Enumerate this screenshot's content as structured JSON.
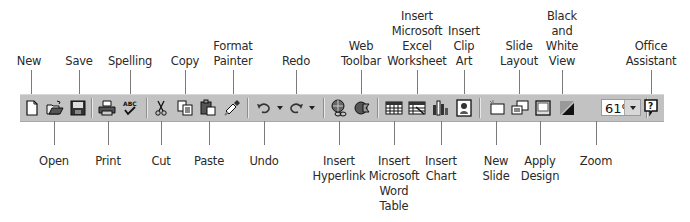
{
  "figure": {
    "type": "PowerPoint Standard toolbar callout diagram",
    "toolbar": {
      "zoom_value": "61%",
      "background": "#c2c2c2"
    },
    "labels_top": [
      {
        "id": "new",
        "text": "New",
        "x": 29,
        "lines": 1
      },
      {
        "id": "save",
        "text": "Save",
        "x": 79,
        "lines": 1
      },
      {
        "id": "spelling",
        "text": "Spelling",
        "x": 130,
        "lines": 1
      },
      {
        "id": "copy",
        "text": "Copy",
        "x": 185,
        "lines": 1
      },
      {
        "id": "format-painter",
        "text": "Format\nPainter",
        "x": 233,
        "lines": 2
      },
      {
        "id": "redo",
        "text": "Redo",
        "x": 296,
        "lines": 1
      },
      {
        "id": "web-toolbar",
        "text": "Web\nToolbar",
        "x": 361,
        "lines": 2
      },
      {
        "id": "insert-excel-worksheet",
        "text": "Insert\nMicrosoft\nExcel\nWorksheet",
        "x": 417,
        "lines": 4
      },
      {
        "id": "insert-clip-art",
        "text": "Insert\nClip\nArt",
        "x": 464,
        "lines": 3
      },
      {
        "id": "slide-layout",
        "text": "Slide\nLayout",
        "x": 519,
        "lines": 2
      },
      {
        "id": "black-and-white-view",
        "text": "Black\nand\nWhite\nView",
        "x": 562,
        "lines": 4
      },
      {
        "id": "office-assistant",
        "text": "Office\nAssistant",
        "x": 651,
        "lines": 2
      }
    ],
    "labels_bottom": [
      {
        "id": "open",
        "text": "Open",
        "x": 54,
        "lines": 1
      },
      {
        "id": "print",
        "text": "Print",
        "x": 108,
        "lines": 1
      },
      {
        "id": "cut",
        "text": "Cut",
        "x": 161,
        "lines": 1
      },
      {
        "id": "paste",
        "text": "Paste",
        "x": 209,
        "lines": 1
      },
      {
        "id": "undo",
        "text": "Undo",
        "x": 264,
        "lines": 1
      },
      {
        "id": "insert-hyperlink",
        "text": "Insert\nHyperlink",
        "x": 339,
        "lines": 2
      },
      {
        "id": "insert-word-table",
        "text": "Insert\nMicrosoft\nWord\nTable",
        "x": 394,
        "lines": 4
      },
      {
        "id": "insert-chart",
        "text": "Insert\nChart",
        "x": 441,
        "lines": 2
      },
      {
        "id": "new-slide",
        "text": "New\nSlide",
        "x": 496,
        "lines": 2
      },
      {
        "id": "apply-design",
        "text": "Apply\nDesign",
        "x": 540,
        "lines": 2
      },
      {
        "id": "zoom",
        "text": "Zoom",
        "x": 596,
        "lines": 1
      }
    ]
  }
}
